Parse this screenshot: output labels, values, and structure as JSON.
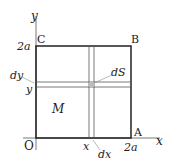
{
  "diagram": {
    "axes": {
      "x_label": "x",
      "y_label": "y",
      "origin_label": "O"
    },
    "corners": {
      "A": "A",
      "B": "B",
      "C": "C"
    },
    "ticks": {
      "x_end": "2a",
      "y_end": "2a",
      "x_pos": "x",
      "y_pos": "y"
    },
    "labels": {
      "region": "M",
      "element": "dS",
      "dx": "dx",
      "dy": "dy"
    }
  }
}
